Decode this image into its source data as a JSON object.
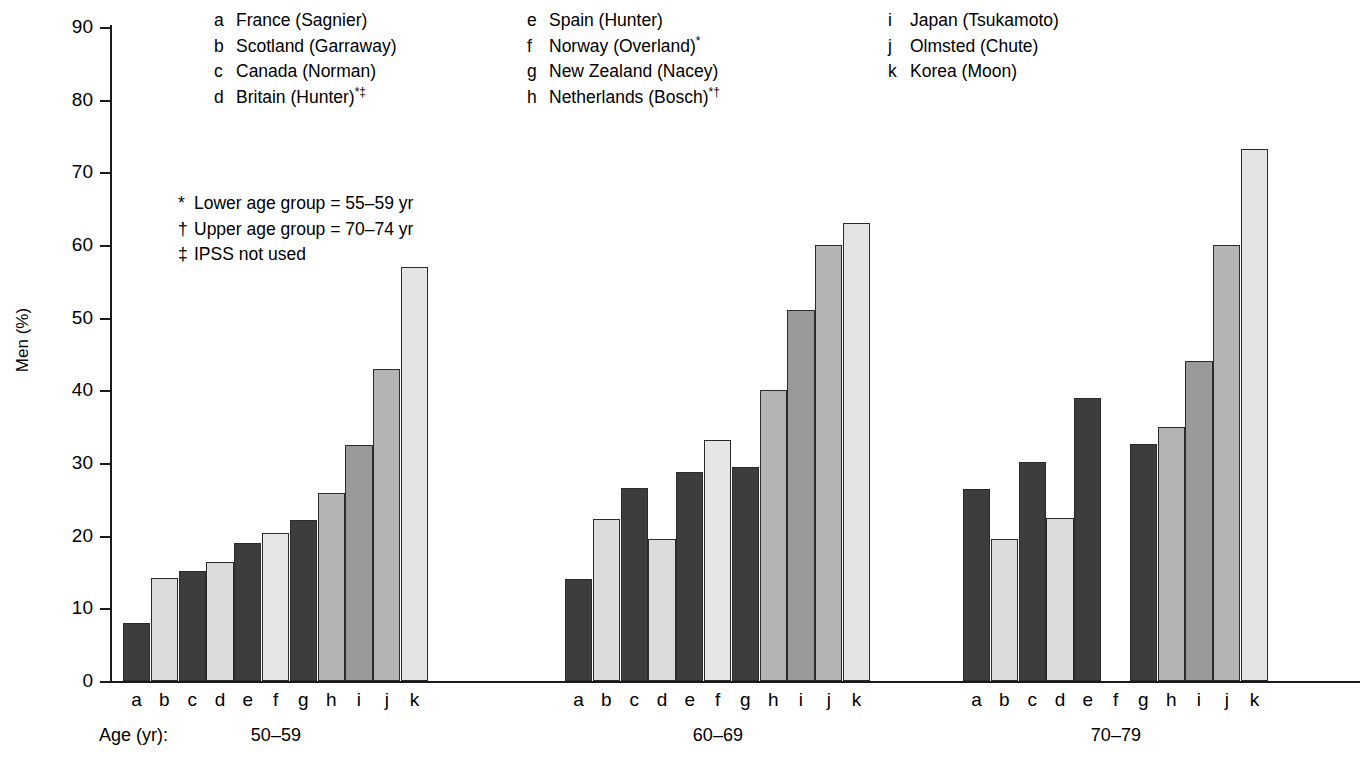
{
  "figure": {
    "caption_prefix": "Figure 26–12",
    "caption_text": "Prevalence of ... ",
    "axis": {
      "ylabel": "Men (%)",
      "yticks": [
        "0",
        "10",
        "20",
        "30",
        "40",
        "50",
        "60",
        "70",
        "80",
        "90"
      ],
      "age_caption": "Age (yr):"
    }
  },
  "legend": {
    "columns": [
      {
        "entries": [
          {
            "key": "a",
            "label": "France (Sagnier)",
            "marks": ""
          },
          {
            "key": "b",
            "label": "Scotland (Garraway)",
            "marks": ""
          },
          {
            "key": "c",
            "label": "Canada (Norman)",
            "marks": ""
          },
          {
            "key": "d",
            "label": "Britain (Hunter)",
            "marks": "*‡"
          }
        ]
      },
      {
        "entries": [
          {
            "key": "e",
            "label": "Spain (Hunter)",
            "marks": ""
          },
          {
            "key": "f",
            "label": "Norway (Overland)",
            "marks": "*"
          },
          {
            "key": "g",
            "label": "New Zealand (Nacey)",
            "marks": ""
          },
          {
            "key": "h",
            "label": "Netherlands (Bosch)",
            "marks": "*†"
          }
        ]
      },
      {
        "entries": [
          {
            "key": "i",
            "label": "Japan (Tsukamoto)",
            "marks": ""
          },
          {
            "key": "j",
            "label": "Olmsted (Chute)",
            "marks": ""
          },
          {
            "key": "k",
            "label": "Korea (Moon)",
            "marks": ""
          }
        ]
      }
    ]
  },
  "footnotes": [
    {
      "mark": "*",
      "text": "Lower age group = 55–59 yr"
    },
    {
      "mark": "†",
      "text": "Upper age group = 70–74 yr"
    },
    {
      "mark": "‡",
      "text": "IPSS not used"
    }
  ],
  "chart_data": {
    "type": "bar",
    "title": "",
    "xlabel": "Age (yr)",
    "ylabel": "Men (%)",
    "ylim": [
      0,
      90
    ],
    "ytick_step": 10,
    "grid": false,
    "legend_position": "top",
    "categories": [
      "50–59",
      "60–69",
      "70–79"
    ],
    "series_keys": [
      "a",
      "b",
      "c",
      "d",
      "e",
      "f",
      "g",
      "h",
      "i",
      "j",
      "k"
    ],
    "series": [
      {
        "key": "a",
        "name": "France (Sagnier)",
        "color": "#3d3d3d",
        "values": [
          8.0,
          14.1,
          26.4
        ]
      },
      {
        "key": "b",
        "name": "Scotland (Garraway)",
        "color": "#dcdcdc",
        "values": [
          14.2,
          22.3,
          19.6
        ]
      },
      {
        "key": "c",
        "name": "Canada (Norman)",
        "color": "#3d3d3d",
        "values": [
          15.2,
          26.6,
          30.2
        ]
      },
      {
        "key": "d",
        "name": "Britain (Hunter)",
        "color": "#dcdcdc",
        "values": [
          16.4,
          19.5,
          22.5
        ]
      },
      {
        "key": "e",
        "name": "Spain (Hunter)",
        "color": "#3d3d3d",
        "values": [
          19.0,
          28.8,
          39.0
        ]
      },
      {
        "key": "f",
        "name": "Norway (Overland)",
        "color": "#e6e6e6",
        "values": [
          20.4,
          33.2,
          null
        ]
      },
      {
        "key": "g",
        "name": "New Zealand (Nacey)",
        "color": "#3d3d3d",
        "values": [
          22.2,
          29.4,
          32.6
        ]
      },
      {
        "key": "h",
        "name": "Netherlands (Bosch)",
        "color": "#b4b4b4",
        "values": [
          25.9,
          40.0,
          35.0
        ]
      },
      {
        "key": "i",
        "name": "Japan (Tsukamoto)",
        "color": "#9a9a9a",
        "values": [
          32.5,
          51.0,
          44.0
        ]
      },
      {
        "key": "j",
        "name": "Olmsted (Chute)",
        "color": "#b4b4b4",
        "values": [
          43.0,
          60.0,
          60.0
        ]
      },
      {
        "key": "k",
        "name": "Korea (Moon)",
        "color": "#e4e4e4",
        "values": [
          57.0,
          63.0,
          73.2
        ]
      }
    ]
  }
}
